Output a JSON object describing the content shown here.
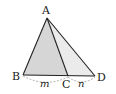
{
  "diagram": {
    "type": "geometry-triangle",
    "points": {
      "A": {
        "label": "A",
        "x": 47,
        "y": 18
      },
      "B": {
        "label": "B",
        "x": 23,
        "y": 75
      },
      "C": {
        "label": "C",
        "x": 68,
        "y": 76
      },
      "D": {
        "label": "D",
        "x": 95,
        "y": 76
      }
    },
    "segments": [
      "AB",
      "AC",
      "AD",
      "BD"
    ],
    "shaded_regions": [
      {
        "name": "triangle-ABC",
        "fill": "#d6d6d6"
      },
      {
        "name": "triangle-ACD",
        "fill": "#ebebeb"
      }
    ],
    "lengths": {
      "BC": "m",
      "CD": "n"
    },
    "colors": {
      "line": "#222222",
      "shade_dark": "#d6d6d6",
      "shade_light": "#ebebeb",
      "dashed": "#9a9a9a"
    }
  }
}
